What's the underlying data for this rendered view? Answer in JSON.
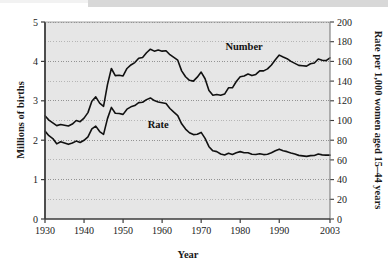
{
  "figure": {
    "background": "#ffffff",
    "plot_background": "#e6e6e6",
    "frame_color": "#3b3b3b",
    "gridline_color": "#8a8a8a",
    "line_color": "#111111"
  },
  "labels": {
    "y_left_title": "Millions of births",
    "y_right_title": "Rate per 1,000 women aged 15–44 years",
    "x_title": "Year",
    "series_number": "Number",
    "series_rate": "Rate"
  },
  "axes": {
    "x_ticks": [
      "1930",
      "1940",
      "1950",
      "1960",
      "1970",
      "1980",
      "1990",
      "2003"
    ],
    "x_tick_values": [
      1930,
      1940,
      1950,
      1960,
      1970,
      1980,
      1990,
      2003
    ],
    "y_left_ticks": [
      "0",
      "1",
      "2",
      "3",
      "4",
      "5"
    ],
    "y_left_tick_values": [
      0,
      1,
      2,
      3,
      4,
      5
    ],
    "y_right_ticks": [
      "0",
      "20",
      "40",
      "60",
      "80",
      "100",
      "120",
      "140",
      "160",
      "180",
      "200"
    ],
    "y_right_tick_values": [
      0,
      20,
      40,
      60,
      80,
      100,
      120,
      140,
      160,
      180,
      200
    ]
  },
  "chart_data": {
    "type": "line",
    "title": "",
    "subtitle": "",
    "xlabel": "Year",
    "ylabel": "Millions of births",
    "ylabel_right": "Rate per 1,000 women aged 15–44 years",
    "xlim": [
      1930,
      2003
    ],
    "ylim": [
      0,
      5
    ],
    "ylim_right": [
      0,
      200
    ],
    "grid": true,
    "grid_minor_y": true,
    "legend": "inline-annotations",
    "annotations": [
      {
        "text": "Number",
        "x": 1981,
        "y_left": 4.28
      },
      {
        "text": "Rate",
        "x": 1959,
        "y_left": 2.32
      }
    ],
    "x": [
      1930,
      1931,
      1932,
      1933,
      1934,
      1935,
      1936,
      1937,
      1938,
      1939,
      1940,
      1941,
      1942,
      1943,
      1944,
      1945,
      1946,
      1947,
      1948,
      1949,
      1950,
      1951,
      1952,
      1953,
      1954,
      1955,
      1956,
      1957,
      1958,
      1959,
      1960,
      1961,
      1962,
      1963,
      1964,
      1965,
      1966,
      1967,
      1968,
      1969,
      1970,
      1971,
      1972,
      1973,
      1974,
      1975,
      1976,
      1977,
      1978,
      1979,
      1980,
      1981,
      1982,
      1983,
      1984,
      1985,
      1986,
      1987,
      1988,
      1989,
      1990,
      1991,
      1992,
      1993,
      1994,
      1995,
      1996,
      1997,
      1998,
      1999,
      2000,
      2001,
      2002,
      2003
    ],
    "series": [
      {
        "name": "Number",
        "axis": "left",
        "units": "millions of births",
        "values": [
          2.62,
          2.51,
          2.44,
          2.37,
          2.4,
          2.38,
          2.36,
          2.41,
          2.5,
          2.47,
          2.56,
          2.7,
          2.99,
          3.1,
          2.94,
          2.86,
          3.41,
          3.82,
          3.64,
          3.65,
          3.63,
          3.82,
          3.91,
          3.97,
          4.08,
          4.1,
          4.22,
          4.31,
          4.26,
          4.29,
          4.26,
          4.27,
          4.17,
          4.1,
          4.03,
          3.76,
          3.61,
          3.52,
          3.5,
          3.6,
          3.73,
          3.56,
          3.26,
          3.14,
          3.16,
          3.14,
          3.17,
          3.33,
          3.33,
          3.49,
          3.61,
          3.63,
          3.68,
          3.64,
          3.67,
          3.76,
          3.76,
          3.81,
          3.91,
          4.04,
          4.16,
          4.11,
          4.07,
          4.0,
          3.95,
          3.9,
          3.89,
          3.88,
          3.94,
          3.96,
          4.06,
          4.03,
          4.02,
          4.09
        ]
      },
      {
        "name": "Rate",
        "axis": "right",
        "units": "births per 1,000 women aged 15-44",
        "values": [
          89.2,
          84.6,
          81.7,
          76.3,
          78.5,
          77.2,
          75.8,
          77.1,
          79.1,
          77.6,
          79.9,
          83.4,
          91.5,
          94.3,
          88.8,
          85.9,
          101.9,
          113.3,
          107.3,
          107.1,
          106.2,
          111.5,
          113.9,
          115.2,
          118.1,
          118.5,
          121.2,
          122.9,
          120.2,
          118.8,
          118.0,
          117.2,
          112.2,
          108.5,
          105.0,
          96.6,
          91.3,
          87.6,
          85.7,
          86.1,
          87.9,
          81.8,
          73.4,
          69.2,
          68.4,
          66.0,
          65.0,
          66.8,
          65.5,
          67.2,
          68.4,
          67.3,
          67.3,
          65.7,
          65.5,
          66.3,
          65.4,
          65.8,
          67.3,
          69.2,
          70.9,
          69.3,
          68.4,
          67.0,
          65.9,
          64.6,
          64.1,
          63.6,
          64.3,
          64.4,
          65.9,
          65.1,
          64.8,
          64.8
        ]
      }
    ]
  }
}
